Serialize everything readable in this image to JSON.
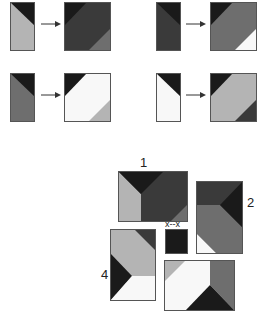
{
  "colors": {
    "black": "#1a1a1a",
    "dark": "#3a3a3a",
    "mid": "#6e6e6e",
    "light": "#b4b4b4",
    "white": "#f8f8f8",
    "border": "#555555"
  },
  "examples": [
    {
      "id": "example-1",
      "source": [
        "black-corner",
        "light-body"
      ],
      "result": [
        "black-corner",
        "dark-body",
        "mid-corner"
      ]
    },
    {
      "id": "example-2",
      "source": [
        "black-corner",
        "dark-body"
      ],
      "result": [
        "black-corner",
        "mid-body",
        "white-corner"
      ]
    },
    {
      "id": "example-3",
      "source": [
        "black-corner",
        "mid-body"
      ],
      "result": [
        "black-corner",
        "white-body",
        "light-corner"
      ]
    },
    {
      "id": "example-4",
      "source": [
        "black-corner",
        "white-body"
      ],
      "result": [
        "black-corner",
        "light-body",
        "dark-corner"
      ]
    }
  ],
  "puzzle": {
    "labels": {
      "piece1": "1",
      "piece2": "2",
      "piece4": "4",
      "missing": "x--x"
    }
  }
}
